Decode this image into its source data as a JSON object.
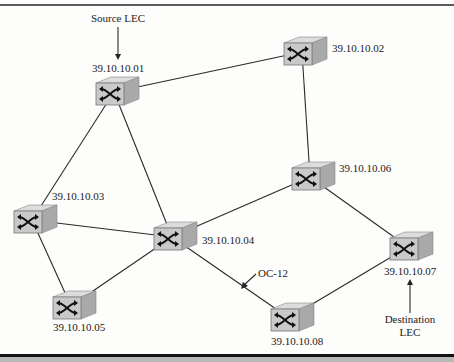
{
  "diagram": {
    "type": "network-topology",
    "nodes": [
      {
        "id": "01",
        "address": "39.10.10.01",
        "kind": "atm-switch"
      },
      {
        "id": "02",
        "address": "39.10.10.02",
        "kind": "atm-switch"
      },
      {
        "id": "03",
        "address": "39.10.10.03",
        "kind": "atm-switch"
      },
      {
        "id": "04",
        "address": "39.10.10.04",
        "kind": "atm-switch"
      },
      {
        "id": "05",
        "address": "39.10.10.05",
        "kind": "atm-switch"
      },
      {
        "id": "06",
        "address": "39.10.10.06",
        "kind": "atm-switch"
      },
      {
        "id": "07",
        "address": "39.10.10.07",
        "kind": "atm-switch"
      },
      {
        "id": "08",
        "address": "39.10.10.08",
        "kind": "atm-switch"
      }
    ],
    "links": [
      [
        "01",
        "02"
      ],
      [
        "01",
        "03"
      ],
      [
        "01",
        "04"
      ],
      [
        "02",
        "06"
      ],
      [
        "03",
        "04"
      ],
      [
        "03",
        "05"
      ],
      [
        "04",
        "05"
      ],
      [
        "04",
        "06"
      ],
      [
        "04",
        "08"
      ],
      [
        "06",
        "07"
      ],
      [
        "08",
        "07"
      ]
    ],
    "annotations": {
      "source": {
        "text": "Source LEC",
        "points_to": "01"
      },
      "destination": {
        "line1": "Destination",
        "line2": "LEC",
        "points_to": "07"
      },
      "link_label": {
        "text": "OC-12",
        "points_to_link": [
          "04",
          "08"
        ]
      }
    },
    "icon": "switch-icon",
    "colors": {
      "switch_face": "#c9c9c9",
      "switch_top": "#dcdcdc",
      "switch_side": "#a9a9a9",
      "line": "#2a2a2a"
    }
  }
}
